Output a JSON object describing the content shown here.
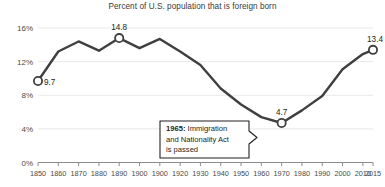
{
  "chart_data": {
    "type": "line",
    "title": "Percent of U.S. population that is foreign born",
    "xlabel": "",
    "ylabel": "",
    "ylim": [
      0,
      16
    ],
    "yticks": [
      "0%",
      "4%",
      "8%",
      "12%",
      "16%"
    ],
    "ytick_values": [
      0,
      4,
      8,
      12,
      16
    ],
    "grid": true,
    "legend": "none",
    "xtick_labels": [
      "1850",
      "1860",
      "1870",
      "1880",
      "1890",
      "1900",
      "1900",
      "1920",
      "1930",
      "1940",
      "1950",
      "1960",
      "1970",
      "1980",
      "1990",
      "2000",
      "2010",
      "2015"
    ],
    "x": [
      1850,
      1860,
      1870,
      1880,
      1890,
      1900,
      1910,
      1920,
      1930,
      1940,
      1950,
      1960,
      1970,
      1980,
      1990,
      2000,
      2010,
      2015
    ],
    "values": [
      9.7,
      13.2,
      14.4,
      13.3,
      14.8,
      13.6,
      14.7,
      13.2,
      11.6,
      8.8,
      6.9,
      5.4,
      4.7,
      6.2,
      7.9,
      11.1,
      12.9,
      13.4
    ],
    "markers": [
      {
        "x": 1850,
        "y": 9.7,
        "label": "9.7"
      },
      {
        "x": 1890,
        "y": 14.8,
        "label": "14.8"
      },
      {
        "x": 1970,
        "y": 4.7,
        "label": "4.7"
      },
      {
        "x": 2015,
        "y": 13.4,
        "label": "13.4"
      }
    ],
    "annotations": [
      {
        "name": "immigration-act-callout",
        "year_bold": "1965:",
        "line1_rest": " Immigration",
        "line2": "and Nationality Act",
        "line3": "is passed"
      }
    ],
    "colors": {
      "line": "#3f3f3f",
      "text": "#231f20",
      "grid": "#e8e8e8",
      "axis": "#8c8c8c",
      "marker_fill": "#ffffff"
    }
  }
}
